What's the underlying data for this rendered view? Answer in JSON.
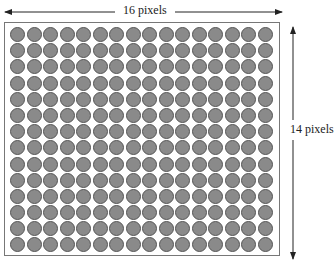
{
  "diagram": {
    "type": "pixel-grid",
    "columns": 16,
    "rows": 14,
    "width_label": "16 pixels",
    "height_label": "14 pixels",
    "dot_color": "#8a8a8a",
    "dot_border_color": "#555555",
    "frame_color": "#777777"
  }
}
